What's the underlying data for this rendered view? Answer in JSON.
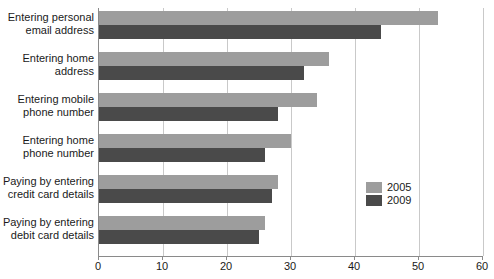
{
  "chart_data": {
    "type": "bar",
    "orientation": "horizontal",
    "title": "",
    "subtitle": "",
    "xlabel": "",
    "ylabel": "",
    "xlim": [
      0,
      60
    ],
    "xticks": [
      0,
      10,
      20,
      30,
      40,
      50,
      60
    ],
    "xtick_labels": [
      "0",
      "10",
      "20",
      "30",
      "40",
      "50",
      "60"
    ],
    "grid": true,
    "grid_axis": "x",
    "legend_position": "inside-right",
    "categories": [
      "Entering personal email address",
      "Entering home address",
      "Entering mobile phone number",
      "Entering home phone number",
      "Paying by entering credit card details",
      "Paying by entering debit card details"
    ],
    "category_lines": [
      [
        "Entering personal",
        "email address"
      ],
      [
        "Entering home",
        "address"
      ],
      [
        "Entering mobile",
        "phone number"
      ],
      [
        "Entering home",
        "phone number"
      ],
      [
        "Paying by entering",
        "credit card details"
      ],
      [
        "Paying by entering",
        "debit card details"
      ]
    ],
    "series": [
      {
        "name": "2005",
        "color": "#9d9d9d",
        "values": [
          53,
          36,
          34,
          30,
          28,
          26
        ]
      },
      {
        "name": "2009",
        "color": "#4a4a4a",
        "values": [
          44,
          32,
          28,
          26,
          27,
          25
        ]
      }
    ]
  },
  "legend": {
    "items": [
      {
        "label": "2005",
        "color": "#9d9d9d"
      },
      {
        "label": "2009",
        "color": "#4a4a4a"
      }
    ]
  },
  "colors": {
    "series_2005": "#9d9d9d",
    "series_2009": "#4a4a4a",
    "gridline": "#c9c9c9",
    "axis": "#8a8a8a",
    "text": "#1a1a1a",
    "background": "#ffffff"
  }
}
